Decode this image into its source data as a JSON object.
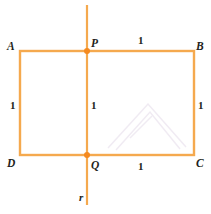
{
  "figure": {
    "colors": {
      "stroke": "#f5a94e",
      "point": "#f58a1f",
      "label": "#231f20",
      "background": "#ffffff"
    },
    "vertices": {
      "A": "A",
      "B": "B",
      "C": "C",
      "D": "D",
      "P": "P",
      "Q": "Q"
    },
    "line_label": "r",
    "lengths": {
      "top": "1",
      "bottom": "1",
      "left": "1",
      "middle": "1",
      "right": "1"
    },
    "geometry": {
      "rect": {
        "x": 20,
        "y": 51,
        "width": 174,
        "height": 104
      },
      "axis": {
        "x": 87,
        "y1": 5,
        "y2": 205
      },
      "points": [
        {
          "name": "P",
          "x": 87,
          "y": 51
        },
        {
          "name": "Q",
          "x": 87,
          "y": 155
        }
      ],
      "stroke_width": 2.2,
      "point_radius": 3
    }
  }
}
